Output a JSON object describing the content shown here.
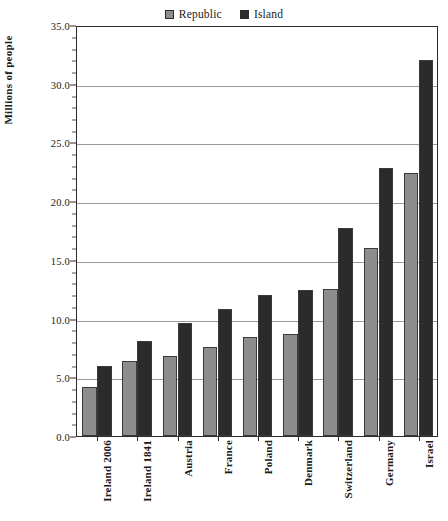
{
  "chart_data": {
    "type": "bar",
    "title": "",
    "xlabel": "",
    "ylabel": "Millions of people",
    "ylim": [
      0.0,
      35.0
    ],
    "ytick_step": 5.0,
    "yticks": [
      "0.0",
      "5.0",
      "10.0",
      "15.0",
      "20.0",
      "25.0",
      "30.0",
      "35.0"
    ],
    "grid": "horizontal",
    "legend_position": "top-center",
    "categories": [
      "Ireland 2006",
      "Ireland 1841",
      "Austria",
      "France",
      "Poland",
      "Denmark",
      "Switzerland",
      "Germany",
      "Israel"
    ],
    "series": [
      {
        "name": "Republic",
        "color": "#8d8d8d",
        "values": [
          4.2,
          6.4,
          6.8,
          7.6,
          8.4,
          8.7,
          12.5,
          16.0,
          22.4
        ]
      },
      {
        "name": "Island",
        "color": "#2b2b2b",
        "values": [
          6.0,
          8.1,
          9.6,
          10.8,
          12.0,
          12.4,
          17.7,
          22.8,
          32.0
        ]
      }
    ]
  },
  "legend": {
    "entries": [
      {
        "label": "Republic",
        "color": "#8d8d8d"
      },
      {
        "label": "Island",
        "color": "#2b2b2b"
      }
    ]
  },
  "axes": {
    "y_title": "Millions of people"
  },
  "colors": {
    "republic": "#8d8d8d",
    "island": "#2b2b2b",
    "gridline": "#9a9a9a",
    "axis": "#2b2b2b",
    "background": "#ffffff"
  }
}
